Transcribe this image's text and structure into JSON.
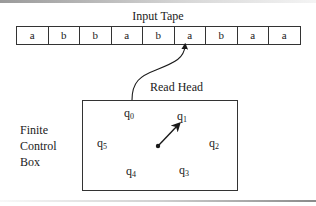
{
  "tape": {
    "title": "Input Tape",
    "cells": [
      "a",
      "b",
      "b",
      "a",
      "b",
      "a",
      "b",
      "a",
      "a"
    ],
    "head_position": 5
  },
  "read_head": {
    "label": "Read Head"
  },
  "control_box": {
    "label_lines": [
      "Finite",
      "Control",
      "Box"
    ],
    "states": [
      {
        "base": "q",
        "sub": "0"
      },
      {
        "base": "q",
        "sub": "1"
      },
      {
        "base": "q",
        "sub": "2"
      },
      {
        "base": "q",
        "sub": "3"
      },
      {
        "base": "q",
        "sub": "4"
      },
      {
        "base": "q",
        "sub": "5"
      }
    ],
    "pointer_to": "q1"
  }
}
